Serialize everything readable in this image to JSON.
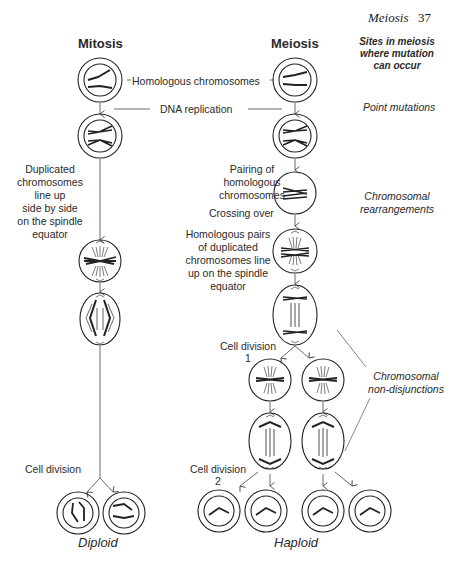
{
  "header": {
    "running_head": "Meiosis",
    "page_number": "37"
  },
  "columns": {
    "mitosis_title": "Mitosis",
    "meiosis_title": "Meiosis",
    "sites_title": [
      "Sites in meiosis",
      "where mutation",
      "can occur"
    ]
  },
  "labels": {
    "homologous_chromosomes": "Homologous chromosomes",
    "dna_replication": "DNA replication",
    "mitosis_lineup": [
      "Duplicated",
      "chromosomes",
      "line up",
      "side by side",
      "on the spindle",
      "equator"
    ],
    "pairing": [
      "Pairing of",
      "homologous",
      "chromosomes"
    ],
    "crossing_over": "Crossing over",
    "meiosis_lineup": [
      "Homologous pairs",
      "of duplicated",
      "chromosomes line",
      "up on the spindle",
      "equator"
    ],
    "cell_division_1": [
      "Cell division",
      "1"
    ],
    "cell_division_2": [
      "Cell division",
      "2"
    ],
    "mitosis_cell_division": "Cell division",
    "diploid": "Diploid",
    "haploid": "Haploid"
  },
  "mutation_sites": {
    "point_mutations": "Point mutations",
    "rearrangements": [
      "Chromosomal",
      "rearrangements"
    ],
    "non_disjunctions": [
      "Chromosomal",
      "non-disjunctions"
    ]
  }
}
